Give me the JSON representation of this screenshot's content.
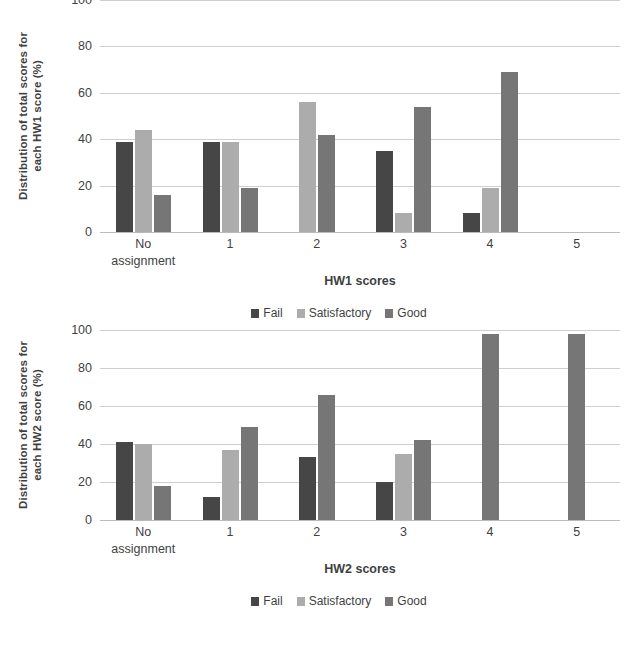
{
  "colors": {
    "fail": "#464646",
    "satisfactory": "#acacac",
    "good": "#767676",
    "grid": "#cfcfcf",
    "text": "#3f3f3f",
    "background": "#ffffff"
  },
  "charts": [
    {
      "id": "hw1",
      "ytitle_line1": "Distribution of total scores for",
      "ytitle_line2": "each HW1 score (%)",
      "xtitle": "HW1 scores",
      "yticks": [
        "0",
        "20",
        "40",
        "60",
        "80",
        "100"
      ],
      "xticks": [
        {
          "line1": "No",
          "line2": "assignment"
        },
        {
          "line1": "1",
          "line2": ""
        },
        {
          "line1": "2",
          "line2": ""
        },
        {
          "line1": "3",
          "line2": ""
        },
        {
          "line1": "4",
          "line2": ""
        },
        {
          "line1": "5",
          "line2": ""
        }
      ],
      "legend": [
        {
          "label": "Fail",
          "key": "fail"
        },
        {
          "label": "Satisfactory",
          "key": "satisfactory"
        },
        {
          "label": "Good",
          "key": "good"
        }
      ]
    },
    {
      "id": "hw2",
      "ytitle_line1": "Distribution of total scores for",
      "ytitle_line2": "each HW2 score (%)",
      "xtitle": "HW2 scores",
      "yticks": [
        "0",
        "20",
        "40",
        "60",
        "80",
        "100"
      ],
      "xticks": [
        {
          "line1": "No",
          "line2": "assignment"
        },
        {
          "line1": "1",
          "line2": ""
        },
        {
          "line1": "2",
          "line2": ""
        },
        {
          "line1": "3",
          "line2": ""
        },
        {
          "line1": "4",
          "line2": ""
        },
        {
          "line1": "5",
          "line2": ""
        }
      ],
      "legend": [
        {
          "label": "Fail",
          "key": "fail"
        },
        {
          "label": "Satisfactory",
          "key": "satisfactory"
        },
        {
          "label": "Good",
          "key": "good"
        }
      ]
    }
  ],
  "chart_data": [
    {
      "type": "bar",
      "title": "",
      "xlabel": "HW1 scores",
      "ylabel": "Distribution of total scores for each HW1 score (%)",
      "categories": [
        "No assignment",
        "1",
        "2",
        "3",
        "4",
        "5"
      ],
      "series": [
        {
          "name": "Fail",
          "color": "#464646",
          "values": [
            39,
            39,
            0,
            35,
            8,
            0
          ]
        },
        {
          "name": "Satisfactory",
          "color": "#acacac",
          "values": [
            44,
            39,
            56,
            8,
            19,
            0
          ]
        },
        {
          "name": "Good",
          "color": "#767676",
          "values": [
            16,
            19,
            42,
            54,
            69,
            0
          ]
        }
      ],
      "ylim": [
        0,
        100
      ],
      "ytick_step": 20,
      "grid": true,
      "legend_position": "bottom"
    },
    {
      "type": "bar",
      "title": "",
      "xlabel": "HW2 scores",
      "ylabel": "Distribution of total scores for each HW2 score (%)",
      "categories": [
        "No assignment",
        "1",
        "2",
        "3",
        "4",
        "5"
      ],
      "series": [
        {
          "name": "Fail",
          "color": "#464646",
          "values": [
            41,
            12,
            33,
            20,
            0,
            0
          ]
        },
        {
          "name": "Satisfactory",
          "color": "#acacac",
          "values": [
            40,
            37,
            0,
            35,
            0,
            0
          ]
        },
        {
          "name": "Good",
          "color": "#767676",
          "values": [
            18,
            49,
            66,
            42,
            98,
            98
          ]
        }
      ],
      "ylim": [
        0,
        100
      ],
      "ytick_step": 20,
      "grid": true,
      "legend_position": "bottom"
    }
  ]
}
